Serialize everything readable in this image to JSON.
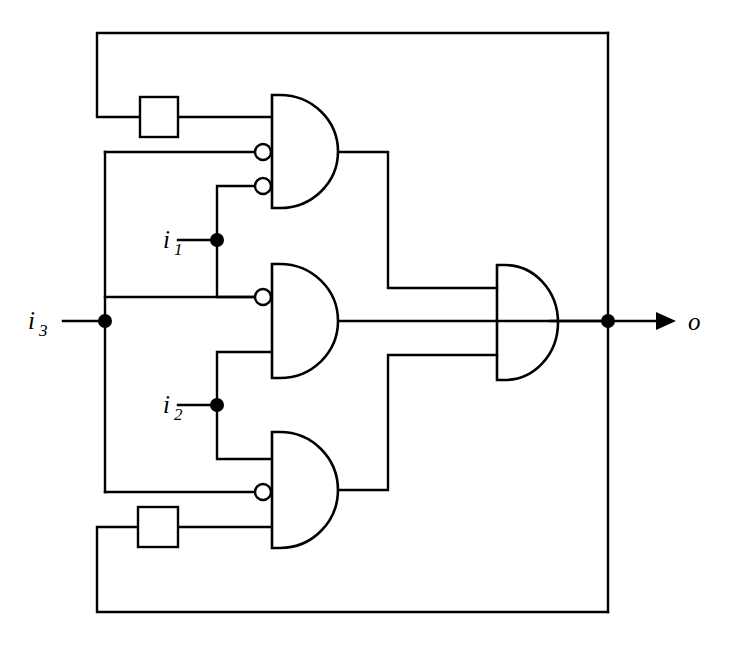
{
  "diagram": {
    "title": "Sequential logic circuit with three AND gates, one OR gate and two delay elements",
    "type": "logic-circuit-schematic",
    "background_color": "#ffffff",
    "line_color": "#000000",
    "width": 736,
    "height": 647
  },
  "inputs": [
    {
      "id": "i1",
      "label": "i",
      "subscript": "1",
      "label_x": 163,
      "label_y": 248,
      "dot_x": 217,
      "dot_y": 240
    },
    {
      "id": "i2",
      "label": "i",
      "subscript": "2",
      "label_x": 163,
      "label_y": 413,
      "dot_x": 217,
      "dot_y": 405
    },
    {
      "id": "i3",
      "label": "i",
      "subscript": "3",
      "label_x": 28,
      "label_y": 329,
      "dot_x": 105,
      "dot_y": 321
    }
  ],
  "outputs": [
    {
      "id": "o",
      "label": "o",
      "subscript": "",
      "label_x": 688,
      "label_y": 330,
      "dot_x": 608,
      "dot_y": 321
    }
  ],
  "gates": [
    {
      "id": "and-top",
      "kind": "and",
      "label": "AND",
      "x": 272,
      "y": 95,
      "w": 58,
      "h": 113,
      "inputs": [
        {
          "name": "in-a",
          "y": 117,
          "inverted": false
        },
        {
          "name": "in-b",
          "y": 152,
          "inverted": true
        },
        {
          "name": "in-c",
          "y": 186,
          "inverted": true
        }
      ],
      "output_y": 152
    },
    {
      "id": "and-middle",
      "kind": "and",
      "label": "AND",
      "x": 272,
      "y": 264,
      "w": 58,
      "h": 114,
      "inputs": [
        {
          "name": "in-a",
          "y": 297,
          "inverted": true
        },
        {
          "name": "in-b",
          "y": 352,
          "inverted": false
        }
      ],
      "output_y": 321
    },
    {
      "id": "and-bottom",
      "kind": "and",
      "label": "AND",
      "x": 272,
      "y": 432,
      "w": 58,
      "h": 116,
      "inputs": [
        {
          "name": "in-a",
          "y": 459,
          "inverted": false
        },
        {
          "name": "in-b",
          "y": 492,
          "inverted": true
        },
        {
          "name": "in-c",
          "y": 527,
          "inverted": false
        }
      ],
      "output_y": 490
    },
    {
      "id": "or-output",
      "kind": "or",
      "label": "OR",
      "x": 497,
      "y": 265,
      "w": 53,
      "h": 115,
      "inputs": [
        {
          "name": "in-a",
          "y": 288,
          "inverted": false
        },
        {
          "name": "in-b",
          "y": 321,
          "inverted": false
        },
        {
          "name": "in-c",
          "y": 355,
          "inverted": false
        }
      ],
      "output_y": 321
    }
  ],
  "delays": [
    {
      "id": "delay-top",
      "label": "",
      "x": 140,
      "y": 97,
      "w": 38,
      "h": 40
    },
    {
      "id": "delay-bottom",
      "label": "",
      "x": 138,
      "y": 507,
      "w": 40,
      "h": 40
    }
  ],
  "wires": [
    {
      "id": "i3-stub",
      "d": "M 63 321 L 105 321"
    },
    {
      "id": "i3-bus-vertical",
      "d": "M 105 152 L 105 492"
    },
    {
      "id": "i3-to-and-top",
      "d": "M 105 152 L 262 152"
    },
    {
      "id": "i3-to-and-middle",
      "d": "M 105 297 L 262 297"
    },
    {
      "id": "i3-to-and-bottom",
      "d": "M 105 492 L 262 492"
    },
    {
      "id": "i1-stub",
      "d": "M 178 240 L 217 240"
    },
    {
      "id": "i1-branch-up",
      "d": "M 217 240 L 217 186 L 262 186"
    },
    {
      "id": "i1-branch-down",
      "d": "M 217 240 L 217 297 L 262 297"
    },
    {
      "id": "i2-stub",
      "d": "M 178 405 L 217 405"
    },
    {
      "id": "i2-branch-up",
      "d": "M 217 405 L 217 352 L 272 352"
    },
    {
      "id": "i2-branch-down",
      "d": "M 217 405 L 217 459 L 272 459"
    },
    {
      "id": "top-feedback",
      "d": "M 608 33 L 97 33 L 97 117 L 140 117"
    },
    {
      "id": "delay-top-out",
      "d": "M 178 117 L 272 117"
    },
    {
      "id": "bottom-feedback",
      "d": "M 608 612 L 97 612 L 97 527 L 138 527"
    },
    {
      "id": "delay-bottom-out",
      "d": "M 178 527 L 272 527"
    },
    {
      "id": "and-top-out",
      "d": "M 330 152 L 388 152 L 388 288 L 497 288"
    },
    {
      "id": "and-middle-out",
      "d": "M 330 321 L 608 321"
    },
    {
      "id": "and-bottom-out",
      "d": "M 330 490 L 388 490 L 388 355 L 497 355"
    },
    {
      "id": "or-out-to-dot",
      "d": "M 550 321 L 608 321"
    },
    {
      "id": "output-right-bus",
      "d": "M 608 33 L 608 612"
    },
    {
      "id": "output-arrow-line",
      "d": "M 608 321 L 662 321"
    }
  ],
  "junction_dots": [
    {
      "id": "dot-i1",
      "x": 217,
      "y": 240,
      "r": 7
    },
    {
      "id": "dot-i2",
      "x": 217,
      "y": 405,
      "r": 7
    },
    {
      "id": "dot-i3",
      "x": 105,
      "y": 321,
      "r": 7
    },
    {
      "id": "dot-output",
      "x": 608,
      "y": 321,
      "r": 7
    }
  ]
}
